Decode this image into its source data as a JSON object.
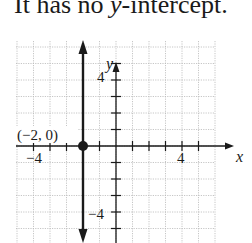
{
  "caption": {
    "prefix": "It has no ",
    "italic": "y",
    "suffix": "-intercept."
  },
  "chart_data": {
    "type": "line",
    "title": "It has no y-intercept.",
    "xlabel": "x",
    "ylabel": "y",
    "xlim": [
      -6,
      6
    ],
    "ylim": [
      -6,
      6
    ],
    "grid": true,
    "x_tick_labels": [
      "-4",
      "4"
    ],
    "y_tick_labels": [
      "4",
      "-4"
    ],
    "series": [
      {
        "name": "x = -2",
        "kind": "vertical-line",
        "x": [
          -2,
          -2
        ],
        "y": [
          -6,
          6
        ],
        "arrows": "both"
      }
    ],
    "points": [
      {
        "x": -2,
        "y": 0,
        "label": "(−2, 0)",
        "filled": true
      }
    ],
    "annotations": [
      "(−2, 0)"
    ]
  },
  "labels": {
    "x_axis": "x",
    "y_axis": "y",
    "x_neg4": "−4",
    "x_pos4": "4",
    "y_pos4": "4",
    "y_neg4": "−4",
    "point": "(−2, 0)"
  },
  "colors": {
    "line": "#1a1a1a",
    "grid": "#b8b8b8",
    "axis": "#1a1a1a"
  }
}
